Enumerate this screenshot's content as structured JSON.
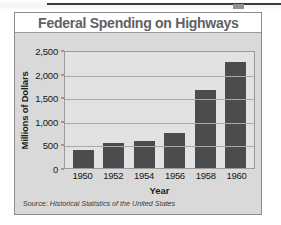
{
  "chart_data": {
    "type": "bar",
    "title": "Federal Spending on Highways",
    "xlabel": "Year",
    "ylabel": "Millions of Dollars",
    "categories": [
      "1950",
      "1952",
      "1954",
      "1956",
      "1958",
      "1960"
    ],
    "values": [
      380,
      520,
      580,
      750,
      1650,
      2250
    ],
    "ylim": [
      0,
      2500
    ],
    "ytick_labels": [
      "0",
      "500",
      "1,000",
      "1,500",
      "2,000",
      "2,500"
    ],
    "ytick_values": [
      0,
      500,
      1000,
      1500,
      2000,
      2500
    ],
    "grid": true,
    "legend": false,
    "series": [
      {
        "name": "Federal Spending on Highways",
        "values": [
          380,
          520,
          580,
          750,
          1650,
          2250
        ]
      }
    ],
    "bar_color": "#4c4c4e",
    "plot_background": "#e2e2e2",
    "title_color": "#616164"
  },
  "source": {
    "label": "Source:",
    "text": "Historical Statistics of the United States"
  }
}
